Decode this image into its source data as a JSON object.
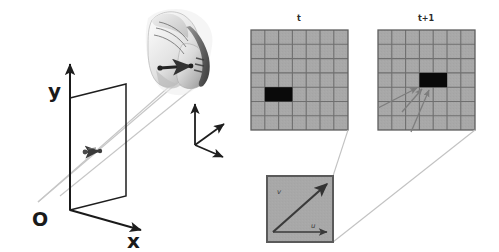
{
  "figure": {
    "background_color": "#ffffff"
  },
  "scene": {
    "name": "camera-projection-scene",
    "origin_label": "O",
    "axis_y_label": "y",
    "axis_x_label": "x",
    "image_plane": {
      "name": "image-plane",
      "stroke_color": "#1e1e1e"
    },
    "projected_vector": {
      "name": "projected-motion-vector",
      "color": "#3d3d3d"
    },
    "object": {
      "name": "shoe-photo",
      "description": "grayscale photo of a sneaker",
      "motion_arrow_color": "#2a2a2a"
    },
    "object_frame": {
      "name": "object-coordinate-frame",
      "axes": 3,
      "color": "#1e1e1e"
    },
    "projection_rays": {
      "name": "projection-rays",
      "color": "#bdbdbd",
      "count": 3
    }
  },
  "grids": {
    "cell_fill": "#a8a8a8",
    "cell_stroke": "#6f6f6f",
    "block_fill": "#0a0a0a",
    "columns": 7,
    "rows": 7,
    "panels": [
      {
        "name": "grid-panel-t",
        "caption": "t",
        "block": {
          "col": 1,
          "row": 4,
          "width_cells": 2,
          "height_cells": 1
        }
      },
      {
        "name": "grid-panel-t-plus-1",
        "caption": "t+1",
        "block": {
          "col": 3,
          "row": 3,
          "width_cells": 2,
          "height_cells": 1
        }
      }
    ]
  },
  "detail": {
    "name": "flow-detail-box",
    "fill": "#a8a8a8",
    "stroke": "#5a5a5a",
    "u_label": "u",
    "v_label": "v",
    "vector_color": "#3a3a3a",
    "callout_color": "#c2c2c2"
  },
  "colors": {
    "ink": "#1a1a1a",
    "ray": "#bdbdbd",
    "grid_fill": "#a8a8a8",
    "grid_line": "#6f6f6f",
    "block": "#0a0a0a",
    "arrow": "#4a4a4a"
  }
}
